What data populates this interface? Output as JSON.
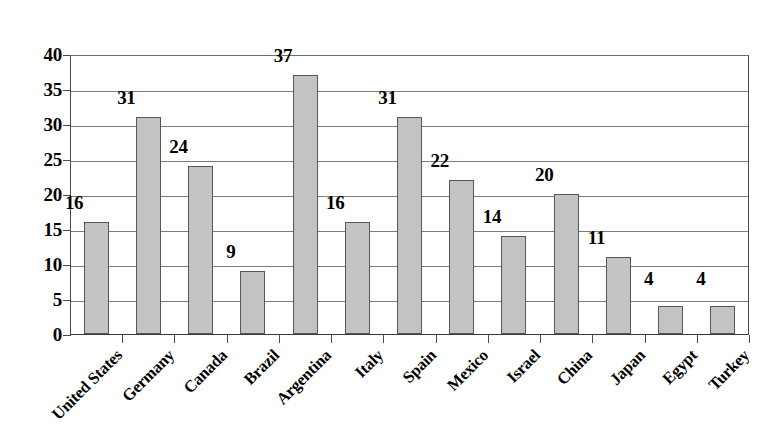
{
  "chart_data": {
    "type": "bar",
    "title": "",
    "subtitle": "",
    "xlabel": "",
    "ylabel": "",
    "categories": [
      "United States",
      "Germany",
      "Canada",
      "Brazil",
      "Argentina",
      "Italy",
      "Spain",
      "Mexico",
      "Israel",
      "China",
      "Japan",
      "Egypt",
      "Turkey"
    ],
    "values": [
      16,
      31,
      24,
      9,
      37,
      16,
      31,
      22,
      14,
      20,
      11,
      4,
      4
    ],
    "data_labels": [
      "16",
      "31",
      "24",
      "9",
      "37",
      "16",
      "31",
      "22",
      "14",
      "20",
      "11",
      "4",
      "4"
    ],
    "ylim": [
      0,
      40
    ],
    "ytick_step": 5,
    "ytick_labels": [
      "40",
      "35",
      "30",
      "25",
      "20",
      "15",
      "10",
      "5",
      "0"
    ],
    "ytick_values": [
      40,
      35,
      30,
      25,
      20,
      15,
      10,
      5,
      0
    ],
    "grid": "horizontal",
    "legend": "none",
    "legend_position": "none",
    "bar_fill_color": "#c3c3c3",
    "bar_border_color": "#575757",
    "gridline_color": "#7c7c7c",
    "axis_color": "#4a4a4a",
    "background_color": "#ffffff",
    "text_color": "#000000",
    "xtick_label_rotation": -45
  }
}
